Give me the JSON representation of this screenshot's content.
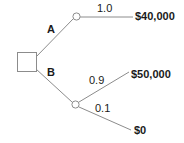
{
  "diagram": {
    "type": "decision-tree",
    "title": "",
    "background_color": "#ffffff",
    "line_color": "#8c8c8c",
    "text_color": "#1a1a1a",
    "nodes": {
      "decision": {
        "shape": "square",
        "label": ""
      },
      "chance_top": {
        "shape": "circle",
        "label": ""
      },
      "chance_bottom": {
        "shape": "circle",
        "label": ""
      }
    },
    "branches": {
      "a": {
        "label": "A",
        "probability": "1.0",
        "payoff": "$40,000"
      },
      "b": {
        "label": "B"
      },
      "b_high": {
        "probability": "0.9",
        "payoff": "$50,000"
      },
      "b_low": {
        "probability": "0.1",
        "payoff": "$0"
      }
    }
  }
}
